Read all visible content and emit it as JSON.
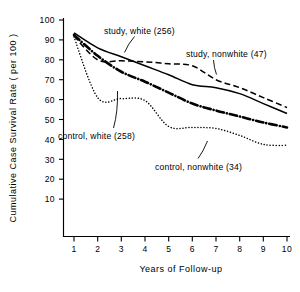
{
  "chart_data": {
    "type": "line",
    "title": "",
    "xlabel": "Years of Follow-up",
    "ylabel": "Cumulative Case Survival Rate ( per 100 )",
    "xlim": [
      0,
      10
    ],
    "ylim": [
      0,
      100
    ],
    "grid": false,
    "legend_position": "inline-annotations",
    "x": [
      1,
      2,
      3,
      4,
      5,
      6,
      7,
      8,
      9,
      10
    ],
    "xticks": [
      "1",
      "2",
      "3",
      "4",
      "5",
      "6",
      "7",
      "8",
      "9",
      "10"
    ],
    "yticks": [
      "10",
      "20",
      "30",
      "40",
      "50",
      "60",
      "70",
      "80",
      "90",
      "100"
    ],
    "series": [
      {
        "name": "study, white (256)",
        "label": "study, white (256)",
        "n": 256,
        "style": "solid",
        "values": [
          93.5,
          86.0,
          81.5,
          77.0,
          72.5,
          67.5,
          66.0,
          63.0,
          58.0,
          53.0
        ]
      },
      {
        "name": "study, nonwhite (47)",
        "label": "study, nonwhite (47)",
        "n": 47,
        "style": "dashed",
        "values": [
          92.0,
          80.0,
          79.5,
          79.0,
          78.0,
          77.0,
          70.0,
          66.0,
          61.0,
          56.0
        ]
      },
      {
        "name": "control, white (258)",
        "label": "control, white (258)",
        "n": 258,
        "style": "dash-dot",
        "values": [
          92.5,
          82.0,
          74.0,
          69.0,
          63.5,
          58.0,
          54.5,
          51.5,
          48.5,
          46.0
        ]
      },
      {
        "name": "control, nonwhite (34)",
        "label": "control, nonwhite (34)",
        "n": 34,
        "style": "dotted",
        "values": [
          91.5,
          61.0,
          60.5,
          59.5,
          46.5,
          46.0,
          45.5,
          42.0,
          37.5,
          37.0
        ]
      }
    ]
  },
  "axis": {
    "y_title": "Cumulative Case Survival Rate ( per 100 )",
    "x_title": "Years of Follow-up",
    "y_tick_labels": [
      "100",
      "90",
      "80",
      "70",
      "60",
      "50",
      "40",
      "30",
      "20",
      "10"
    ],
    "x_tick_labels": [
      "1",
      "2",
      "3",
      "4",
      "5",
      "6",
      "7",
      "8",
      "9",
      "10"
    ]
  },
  "annotations": {
    "study_white": "study, white (256)",
    "study_nonwhite": "study, nonwhite (47)",
    "control_white": "control, white (258)",
    "control_nonwhite": "control, nonwhite (34)"
  },
  "colors": {
    "ink": "#000000",
    "background": "#ffffff"
  }
}
